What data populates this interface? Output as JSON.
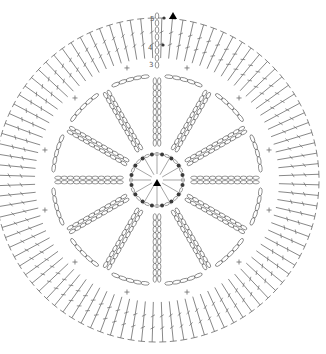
{
  "diagram": {
    "type": "crochet-chart",
    "center": {
      "x": 157,
      "y": 180
    },
    "colors": {
      "stroke": "#6a6a6a",
      "dot": "#3a3a3a",
      "marker": "#000000",
      "background": "#ffffff"
    },
    "start_marker": {
      "x": 157,
      "y": 185,
      "label": "start"
    },
    "top_marker": {
      "x": 173,
      "y": 16
    },
    "rounds": [
      {
        "round": 1,
        "stitch": "slip-stitch-dots",
        "count": 16,
        "radius": 26
      },
      {
        "round": 2,
        "stitch": "chain-spokes",
        "count": 12,
        "r_inner": 30,
        "r_outer": 108
      },
      {
        "round": 3,
        "stitch": "chain-arcs",
        "count": 12,
        "radius": 112
      },
      {
        "round": 4,
        "stitch": "single-crochet",
        "count": 12,
        "radius": 116
      },
      {
        "round": 5,
        "stitch": "double-crochet",
        "count": 96,
        "r_inner": 122,
        "r_outer": 162
      }
    ],
    "row_labels": [
      {
        "text": "5",
        "x": 150,
        "y": 21
      },
      {
        "text": "4",
        "x": 148,
        "y": 50
      },
      {
        "text": "3",
        "x": 149,
        "y": 67
      }
    ]
  }
}
